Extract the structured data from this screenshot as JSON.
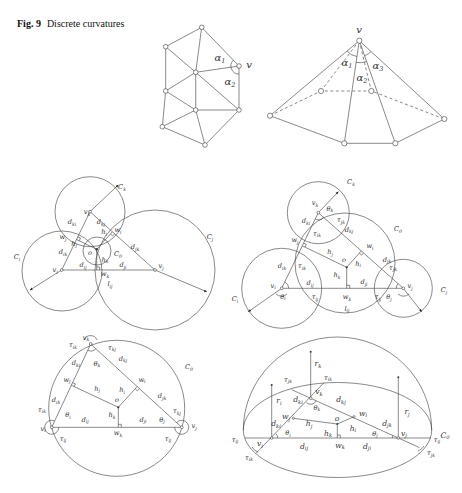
{
  "figure": {
    "number_label": "Fig. 9",
    "caption": "Discrete curvatures"
  },
  "diagrams": {
    "mesh": {
      "description": "triangle mesh with vertex v and angles alpha1, alpha2",
      "labels": [
        [
          "α",
          "1"
        ],
        [
          "α",
          "2"
        ],
        [
          "v",
          ""
        ]
      ]
    },
    "pyramid": {
      "description": "cone/pyramid at vertex v with angles alpha1..alpha3",
      "labels": [
        [
          "v",
          ""
        ],
        [
          "α",
          "1"
        ],
        [
          "α",
          "2"
        ],
        [
          "α",
          "3"
        ]
      ]
    },
    "tangent_circles": {
      "description": "triangle vi vj vk with circles Ci Cj Ck and small circle C0",
      "labels": [
        [
          "C",
          "k"
        ],
        [
          "C",
          "j"
        ],
        [
          "C",
          "i"
        ],
        [
          "C",
          "0"
        ],
        [
          "v",
          "k"
        ],
        [
          "v",
          "i"
        ],
        [
          "v",
          "j"
        ],
        [
          "d",
          "ki"
        ],
        [
          "d",
          "kj"
        ],
        [
          "w",
          "j"
        ],
        [
          "w",
          "i"
        ],
        [
          "h",
          "j"
        ],
        [
          "h",
          "i"
        ],
        [
          "d",
          "jk"
        ],
        [
          "o",
          ""
        ],
        [
          "h",
          "k"
        ],
        [
          "d",
          "ik"
        ],
        [
          "d",
          "ij"
        ],
        [
          "d",
          "ji"
        ],
        [
          "w",
          "k"
        ],
        [
          "l",
          "ij"
        ]
      ]
    },
    "intersecting_circles": {
      "description": "triangle with intersecting circles and orthogonal circle C0",
      "labels": [
        [
          "C",
          "k"
        ],
        [
          "C",
          "0"
        ],
        [
          "C",
          "j"
        ],
        [
          "C",
          "i"
        ],
        [
          "v",
          "k"
        ],
        [
          "θ",
          "k"
        ],
        [
          "τ",
          "jk"
        ],
        [
          "d",
          "ki"
        ],
        [
          "d",
          "kj"
        ],
        [
          "τ",
          "ik"
        ],
        [
          "w",
          "j"
        ],
        [
          "w",
          "i"
        ],
        [
          "h",
          "j"
        ],
        [
          "o",
          ""
        ],
        [
          "h",
          "i"
        ],
        [
          "d",
          "jk"
        ],
        [
          "τ",
          "jk"
        ],
        [
          "d",
          "ik"
        ],
        [
          "τ",
          "ik"
        ],
        [
          "h",
          "k"
        ],
        [
          "d",
          "ji"
        ],
        [
          "d",
          "ij"
        ],
        [
          "v",
          "i"
        ],
        [
          "θ",
          "i"
        ],
        [
          "τ",
          "ij"
        ],
        [
          "w",
          "k"
        ],
        [
          "l",
          "ij"
        ],
        [
          "τ",
          "ij"
        ],
        [
          "θ",
          "j"
        ],
        [
          "v",
          "j"
        ]
      ]
    },
    "circumcircle": {
      "description": "triangle inscribed in circle C0",
      "labels": [
        [
          "v",
          "k"
        ],
        [
          "τ",
          "ik"
        ],
        [
          "τ",
          "kj"
        ],
        [
          "d",
          "kj"
        ],
        [
          "d",
          "ki"
        ],
        [
          "θ",
          "k"
        ],
        [
          "C",
          "0"
        ],
        [
          "w",
          "j"
        ],
        [
          "w",
          "i"
        ],
        [
          "h",
          "j"
        ],
        [
          "h",
          "i"
        ],
        [
          "d",
          "jk"
        ],
        [
          "d",
          "ik"
        ],
        [
          "o",
          ""
        ],
        [
          "τ",
          "ik"
        ],
        [
          "τ",
          "kj"
        ],
        [
          "h",
          "k"
        ],
        [
          "θ",
          "i"
        ],
        [
          "d",
          "ij"
        ],
        [
          "d",
          "ji"
        ],
        [
          "θ",
          "j"
        ],
        [
          "v",
          "i"
        ],
        [
          "v",
          "j"
        ],
        [
          "w",
          "k"
        ],
        [
          "τ",
          "ij"
        ],
        [
          "τ",
          "ij"
        ]
      ]
    },
    "hemisphere": {
      "description": "hemisphere over circle C0 with vertical radii ri rj rk",
      "labels": [
        [
          "r",
          "k"
        ],
        [
          "τ",
          "jk"
        ],
        [
          "τ",
          "ik"
        ],
        [
          "r",
          "i"
        ],
        [
          "v",
          "k"
        ],
        [
          "d",
          "ki"
        ],
        [
          "θ",
          "k"
        ],
        [
          "d",
          "kj"
        ],
        [
          "w",
          "j"
        ],
        [
          "w",
          "i"
        ],
        [
          "r",
          "j"
        ],
        [
          "h",
          "j"
        ],
        [
          "o",
          ""
        ],
        [
          "d",
          "jk"
        ],
        [
          "h",
          "i"
        ],
        [
          "d",
          "ki"
        ],
        [
          "θ",
          "i"
        ],
        [
          "h",
          "k"
        ],
        [
          "θ",
          "j"
        ],
        [
          "v",
          "j"
        ],
        [
          "C",
          "0"
        ],
        [
          "τ",
          "ij"
        ],
        [
          "v",
          "i"
        ],
        [
          "d",
          "ij"
        ],
        [
          "w",
          "k"
        ],
        [
          "d",
          "ji"
        ],
        [
          "τ",
          "ij"
        ],
        [
          "τ",
          "jk"
        ],
        [
          "τ",
          "ik"
        ]
      ]
    }
  },
  "colors": {
    "line": "#3a3a3a",
    "text": "#333333",
    "background": "#ffffff"
  }
}
